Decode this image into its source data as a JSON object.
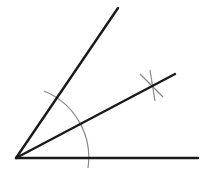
{
  "diagram": {
    "title": "Angle bisector construction",
    "vertex": {
      "x": 16,
      "y": 158
    },
    "rays": [
      {
        "name": "base-ray",
        "x2": 198,
        "y2": 158
      },
      {
        "name": "upper-ray",
        "x2": 118,
        "y2": 8
      },
      {
        "name": "bisector-ray",
        "x2": 175,
        "y2": 74
      }
    ],
    "construction_arc": {
      "cx": 16,
      "cy": 158,
      "r": 72,
      "start": {
        "x": 44,
        "y": 91
      },
      "end": {
        "x": 88,
        "y": 168
      }
    },
    "intersection_marks": [
      {
        "name": "arc-mark-1",
        "x1": 140,
        "y1": 74,
        "x2": 163,
        "y2": 97
      },
      {
        "name": "arc-mark-2",
        "x1": 150,
        "y1": 70,
        "x2": 155,
        "y2": 101
      }
    ],
    "colors": {
      "line": "#1a1a1a",
      "arc": "#8a8a8a",
      "background": "#ffffff"
    }
  }
}
